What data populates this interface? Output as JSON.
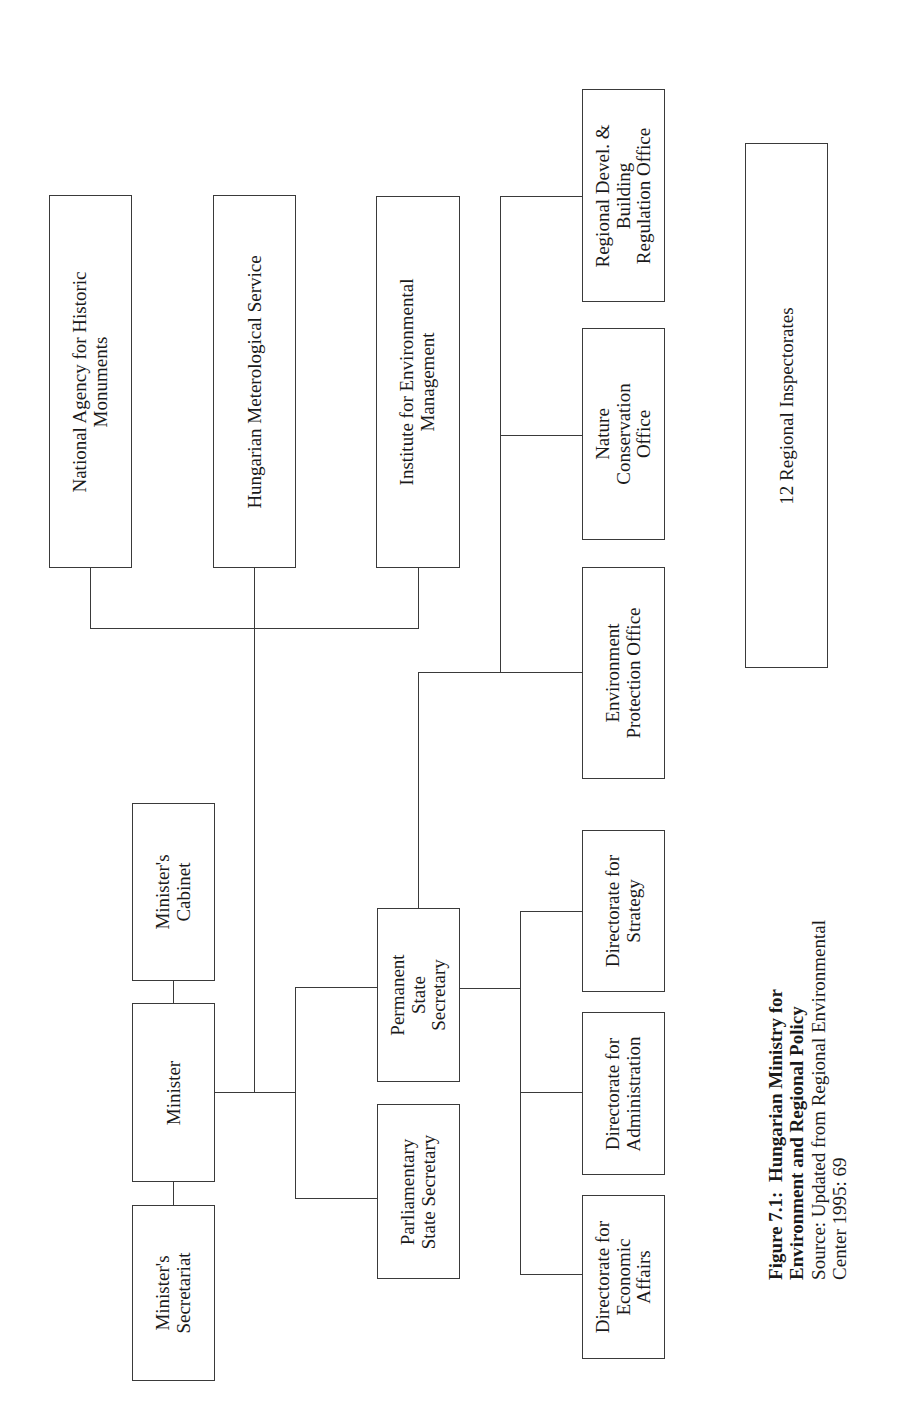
{
  "figure": {
    "orientation": "rotated -90deg (landscape on portrait page)",
    "caption": {
      "label": "Figure 7.1:",
      "title_line1": "Hungarian Ministry for",
      "title_line2": "Environment and Regional Policy",
      "source_line1": "Source: Updated from Regional Environmental",
      "source_line2": "Center 1995: 69"
    }
  },
  "nodes": {
    "national_agency": {
      "line1": "National Agency for Historic",
      "line2": "Monuments"
    },
    "meteorological": {
      "line1": "Hungarian Meterological Service"
    },
    "institute": {
      "line1": "Institute for Environmental",
      "line2": "Management"
    },
    "regional_devel": {
      "line1": "Regional Devel. &",
      "line2": "Building",
      "line3": "Regulation Office"
    },
    "nature_conservation": {
      "line1": "Nature",
      "line2": "Conservation",
      "line3": "Office"
    },
    "environment_protection": {
      "line1": "Environment",
      "line2": "Protection Office"
    },
    "regional_inspectorates": {
      "line1": "12 Regional Inspectorates"
    },
    "ministers_cabinet": {
      "line1": "Minister's",
      "line2": "Cabinet"
    },
    "minister": {
      "line1": "Minister"
    },
    "ministers_secretariat": {
      "line1": "Minister's",
      "line2": "Secretariat"
    },
    "permanent_state_secretary": {
      "line1": "Permanent",
      "line2": "State",
      "line3": "Secretary"
    },
    "parliamentary_state_secretary": {
      "line1": "Parliamentary",
      "line2": "State Secretary"
    },
    "directorate_strategy": {
      "line1": "Directorate for",
      "line2": "Strategy"
    },
    "directorate_administration": {
      "line1": "Directorate for",
      "line2": "Administration"
    },
    "directorate_economic": {
      "line1": "Directorate for",
      "line2": "Economic",
      "line3": "Affairs"
    }
  },
  "hierarchy": {
    "Minister": [
      "Minister's Cabinet",
      "Minister's Secretariat",
      "National Agency for Historic Monuments",
      "Hungarian Meterological Service",
      "Institute for Environmental Management",
      "Permanent State Secretary",
      "Parliamentary State Secretary"
    ],
    "Permanent State Secretary": [
      "Environment Protection Office",
      "Nature Conservation Office",
      "Regional Devel. & Building Regulation Office",
      "Directorate for Strategy",
      "Directorate for Administration",
      "Directorate for Economic Affairs"
    ],
    "standalone": [
      "12 Regional Inspectorates"
    ]
  }
}
